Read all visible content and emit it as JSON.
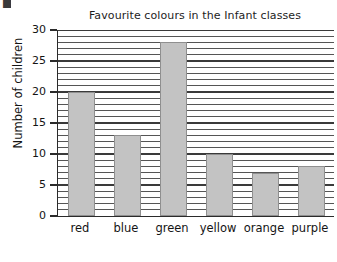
{
  "artifact": {
    "glyph": "■"
  },
  "chart_data": {
    "type": "bar",
    "title": "Favourite colours in the Infant classes",
    "xlabel": "",
    "ylabel": "Number of children",
    "categories": [
      "red",
      "blue",
      "green",
      "yellow",
      "orange",
      "purple"
    ],
    "values": [
      20,
      13,
      28,
      10,
      7,
      8
    ],
    "ylim": [
      0,
      30
    ],
    "ytick_labels": [
      "0",
      "5",
      "10",
      "15",
      "20",
      "25",
      "30"
    ],
    "ytick_values": [
      0,
      5,
      10,
      15,
      20,
      25,
      30
    ],
    "grid": true,
    "grid_interval": 1,
    "legend": "none",
    "bar_color": "#c3c3c3",
    "bar_edge_color": "#8f8f8f",
    "axis_color": "#2b2b2b"
  }
}
